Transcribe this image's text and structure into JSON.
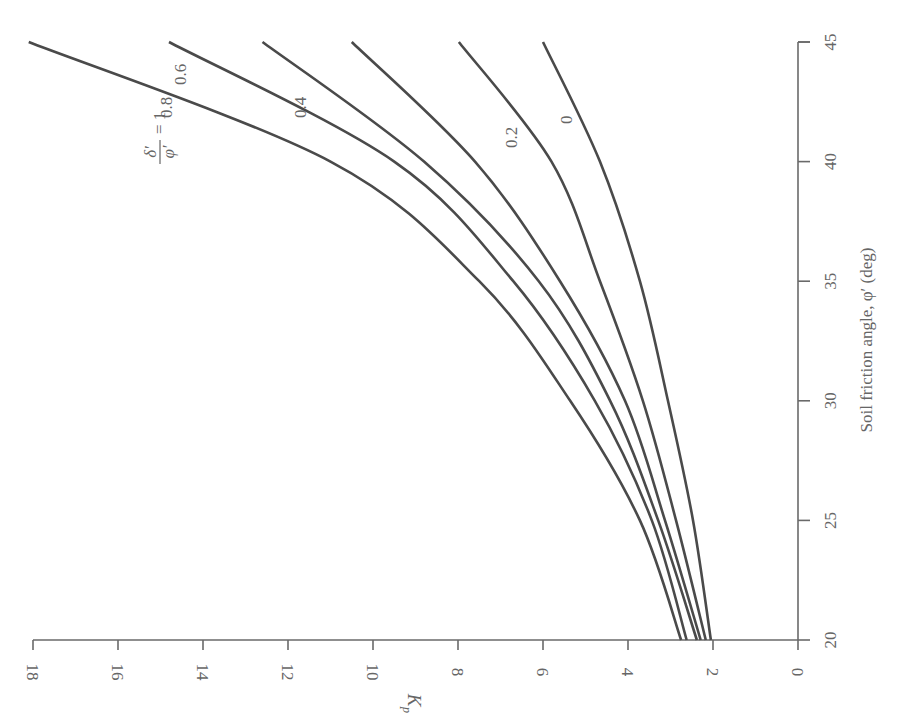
{
  "chart_data": {
    "type": "line",
    "title": "",
    "orientation_note": "figure rotated 90 degrees counter-clockwise",
    "xlabel": "Soil friction angle, φ′ (deg)",
    "ylabel": "K_p",
    "xlim": [
      20,
      45
    ],
    "ylim": [
      0,
      18
    ],
    "x_ticks": [
      20,
      25,
      30,
      35,
      40,
      45
    ],
    "y_ticks": [
      0,
      2,
      4,
      6,
      8,
      10,
      12,
      14,
      16,
      18
    ],
    "grid": false,
    "legend": "inline curve labels",
    "curve_label_title": "δ′/φ′",
    "x": [
      20,
      25,
      30,
      35,
      40,
      45
    ],
    "series": [
      {
        "name": "δ′/φ′ = 1",
        "label": "δ′/φ′ = 1",
        "values": [
          2.75,
          3.72,
          5.36,
          7.5,
          11.0,
          18.1
        ]
      },
      {
        "name": "0.8",
        "label": "0.8",
        "values": [
          2.62,
          3.44,
          4.78,
          6.7,
          9.5,
          14.8
        ]
      },
      {
        "name": "0.6",
        "label": "0.6",
        "values": [
          2.38,
          3.29,
          4.42,
          6.1,
          8.8,
          12.6
        ]
      },
      {
        "name": "0.4",
        "label": "0.4",
        "values": [
          2.29,
          3.13,
          4.07,
          5.6,
          7.6,
          10.5
        ]
      },
      {
        "name": "0.2",
        "label": "0.2",
        "values": [
          2.17,
          2.87,
          3.65,
          4.66,
          5.8,
          7.98
        ]
      },
      {
        "name": "0",
        "label": "0",
        "values": [
          2.05,
          2.47,
          3.06,
          3.72,
          4.66,
          6.0
        ]
      }
    ]
  },
  "labels": {
    "x_axis_title": "Soil friction angle, φ′ (deg)",
    "y_axis_title": "K",
    "y_axis_subscript": "p",
    "curve_1_num": "δ′",
    "curve_1_den": "φ′",
    "curve_1_eq": "= 1",
    "curve_08": "0.8",
    "curve_06": "0.6",
    "curve_04": "0.4",
    "curve_02": "0.2",
    "curve_0": "0"
  }
}
